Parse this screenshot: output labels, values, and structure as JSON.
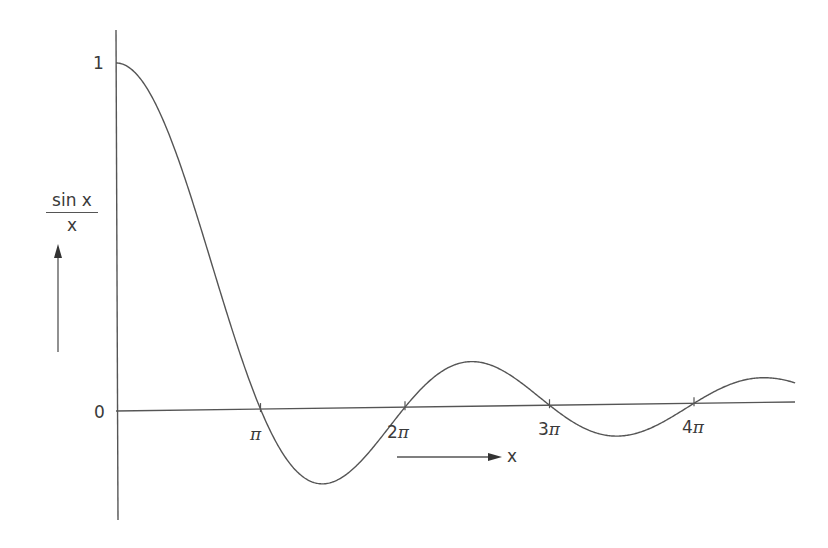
{
  "chart_data": {
    "type": "line",
    "title": "",
    "function": "sin(x)/x",
    "xlabel": "x",
    "ylabel_numerator": "sin x",
    "ylabel_denominator": "x",
    "y_ticks": [
      {
        "value": 1,
        "label": "1"
      },
      {
        "value": 0,
        "label": "0"
      }
    ],
    "x_ticks": [
      {
        "value_pi": 1,
        "label_num": "",
        "label": "π"
      },
      {
        "value_pi": 2,
        "label_num": "2",
        "label": "π"
      },
      {
        "value_pi": 3,
        "label_num": "3",
        "label": "π"
      },
      {
        "value_pi": 4,
        "label_num": "4",
        "label": "π"
      }
    ],
    "x_range_pi": [
      0,
      4.75
    ],
    "ylim": [
      -0.3,
      1.1
    ],
    "grid": false,
    "legend": "none",
    "series": [
      {
        "name": "sin x / x",
        "x_pi": [
          0,
          0.25,
          0.5,
          0.75,
          1,
          1.25,
          1.43,
          1.75,
          2,
          2.25,
          2.46,
          2.75,
          3,
          3.25,
          3.47,
          3.75,
          4,
          4.25,
          4.48,
          4.7
        ],
        "values": [
          1,
          0.9,
          0.637,
          0.3,
          0,
          -0.18,
          -0.217,
          -0.129,
          0,
          0.1,
          0.128,
          0.082,
          0,
          -0.069,
          -0.091,
          -0.06,
          0,
          0.053,
          0.071,
          0.054
        ]
      }
    ],
    "colors": {
      "line": "#555555",
      "text": "#3a3a3a",
      "background": "#ffffff"
    },
    "layout": {
      "origin_px": [
        116,
        411
      ],
      "px_per_pi": 144.5,
      "px_per_unit_y": 348,
      "axis_end_x": 795,
      "axis_slope": -0.0133,
      "y_axis_top": 30,
      "y_axis_bottom": 520
    }
  },
  "labels": {
    "y_one": "1",
    "y_zero": "0",
    "x_arrow_label": "x",
    "t1": "π",
    "t2n": "2",
    "t2": "π",
    "t3n": "3",
    "t3": "π",
    "t4n": "4",
    "t4": "π"
  }
}
